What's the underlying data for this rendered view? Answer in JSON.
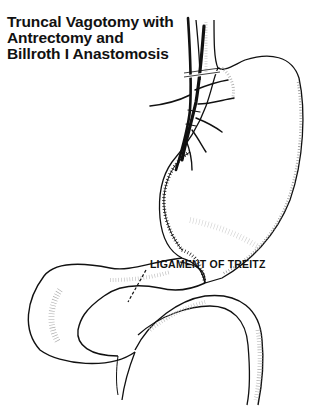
{
  "diagram": {
    "title_lines": [
      "Truncal Vagotomy with",
      "Antrectomy  and",
      "Billroth I Anastomosis"
    ],
    "labels": {
      "ligament": "LIGAMENT OF TREITZ"
    },
    "structures": [
      "esophagus",
      "vagus-nerve-trunks",
      "vagotomy-clamps",
      "stomach-remnant",
      "gastroduodenal-anastomosis",
      "duodenum",
      "jejunum"
    ],
    "colors": {
      "ink": "#111111",
      "stipple": "#9a9a9a",
      "background": "#ffffff"
    }
  }
}
